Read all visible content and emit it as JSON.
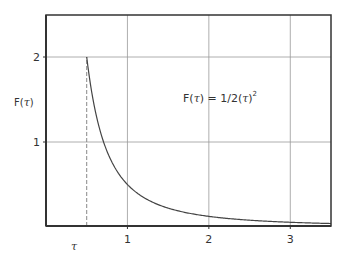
{
  "chart_data": {
    "type": "line",
    "title": "",
    "xlabel": "τ",
    "ylabel": "F(τ)",
    "xlim": [
      0,
      3.5
    ],
    "ylim": [
      0,
      2.5
    ],
    "grid": true,
    "x_ticks": [
      1,
      2,
      3
    ],
    "x_tick_labels": [
      "1",
      "2",
      "3"
    ],
    "y_ticks": [
      1,
      2
    ],
    "y_tick_labels": [
      "1",
      "2"
    ],
    "series": [
      {
        "name": "F(τ) = 1/2(τ)²",
        "function": "1/(2*t^2)",
        "x_start": 0.5,
        "x_end": 3.5,
        "color": "#444444"
      }
    ],
    "reference_lines": [
      {
        "type": "vertical",
        "x": 0.5,
        "y_from": 0,
        "y_to": 2,
        "style": "dashed"
      },
      {
        "type": "horizontal",
        "y": 2,
        "x_from": 0.5,
        "x_to": 3.5,
        "style": "solid"
      }
    ],
    "annotations": [
      {
        "text": "F(τ) = 1/2(τ)",
        "superscript": "2",
        "x": 1.95,
        "y": 1.55
      }
    ]
  },
  "labels": {
    "y_axis": "F(",
    "y_axis_tau": "τ",
    "y_axis_close": ")",
    "x_axis_tau": "τ",
    "formula_prefix": "F(",
    "formula_tau1": "τ",
    "formula_mid": ") = 1/2(",
    "formula_tau2": "τ",
    "formula_close": ")",
    "formula_sup": "2"
  },
  "colors": {
    "axis": "#333333",
    "grid": "#999999",
    "curve": "#444444"
  }
}
